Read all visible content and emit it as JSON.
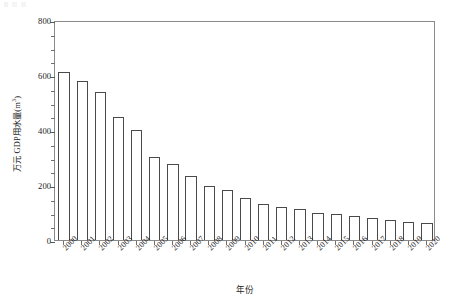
{
  "chart_data": {
    "type": "bar",
    "title": "",
    "xlabel": "年份",
    "ylabel": "万元 GDP用水量(m³)",
    "ylabel_main": "万元 GDP用水量(m",
    "ylabel_sup": "3",
    "ylabel_tail": ")",
    "categories": [
      "2000",
      "2001",
      "2002",
      "2003",
      "2004",
      "2005",
      "2006",
      "2007",
      "2008",
      "2009",
      "2010",
      "2011",
      "2012",
      "2013",
      "2014",
      "2015",
      "2016",
      "2017",
      "2018",
      "2019",
      "2020"
    ],
    "values": [
      610,
      580,
      538,
      449,
      400,
      303,
      275,
      233,
      196,
      181,
      151,
      131,
      121,
      113,
      100,
      93,
      86,
      79,
      73,
      67,
      63
    ],
    "ylim": [
      0,
      800
    ],
    "ytick_labels": [
      "0",
      "200",
      "400",
      "600",
      "800"
    ],
    "ytick_values": [
      0,
      200,
      400,
      600,
      800
    ],
    "yminor_step": 50,
    "grid": false,
    "legend": "none",
    "bar_fill": "#ffffff",
    "bar_edge": "#4a4a4a",
    "axis_color": "#8a8a8a"
  }
}
